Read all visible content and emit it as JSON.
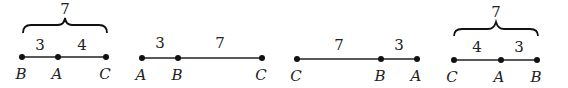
{
  "panels": [
    {
      "points": [
        {
          "label": "B",
          "x": 22
        },
        {
          "label": "A",
          "x": 58
        },
        {
          "label": "C",
          "x": 106
        }
      ],
      "segment_labels": [
        {
          "text": "3",
          "x": 40
        },
        {
          "text": "4",
          "x": 82
        }
      ],
      "brace": {
        "text": "7",
        "x1": 22,
        "x2": 106
      }
    },
    {
      "points": [
        {
          "label": "A",
          "x": 142
        },
        {
          "label": "B",
          "x": 178
        },
        {
          "label": "C",
          "x": 262
        }
      ],
      "segment_labels": [
        {
          "text": "3",
          "x": 160
        },
        {
          "text": "7",
          "x": 220
        }
      ]
    },
    {
      "points": [
        {
          "label": "C",
          "x": 297
        },
        {
          "label": "B",
          "x": 381
        },
        {
          "label": "A",
          "x": 417
        }
      ],
      "segment_labels": [
        {
          "text": "7",
          "x": 339
        },
        {
          "text": "3",
          "x": 399
        }
      ]
    },
    {
      "points": [
        {
          "label": "C",
          "x": 454
        },
        {
          "label": "A",
          "x": 501
        },
        {
          "label": "B",
          "x": 537
        }
      ],
      "segment_labels": [
        {
          "text": "4",
          "x": 477
        },
        {
          "text": "3",
          "x": 519
        }
      ],
      "brace": {
        "text": "7",
        "x1": 454,
        "x2": 537
      }
    }
  ]
}
